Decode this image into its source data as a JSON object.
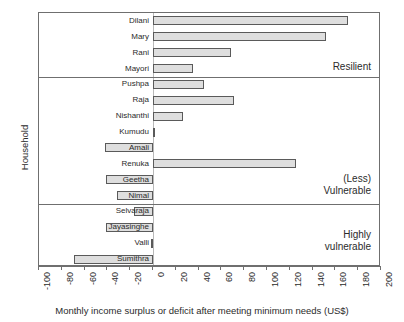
{
  "chart_data": {
    "type": "bar",
    "orientation": "horizontal",
    "title": "",
    "xlabel": "Monthly income surplus or deficit after meeting minimum needs (US$)",
    "ylabel": "Household",
    "xlim": [
      -100,
      200
    ],
    "xticks": [
      -100,
      -80,
      -60,
      -40,
      -20,
      0,
      20,
      40,
      60,
      80,
      100,
      120,
      140,
      160,
      180,
      200
    ],
    "xticklabels": [
      "-100",
      "-80",
      "-60",
      "-40",
      "-20",
      "0",
      "20",
      "40",
      "60",
      "80",
      "100",
      "120",
      "140",
      "160",
      "180",
      "200"
    ],
    "grid": false,
    "legend": false,
    "bar_fill": "#dedede",
    "bar_border": "#5a5a5a",
    "categories": [
      "Dilani",
      "Mary",
      "Rani",
      "Mayori",
      "Pushpa",
      "Raja",
      "Nishanthi",
      "Kumudu",
      "Amali",
      "Renuka",
      "Geetha",
      "Nimal",
      "Selvarajа",
      "Jayasinghe",
      "Valli",
      "Sumithra"
    ],
    "values": [
      171,
      152,
      68,
      35,
      45,
      71,
      26,
      2,
      -42,
      125,
      -41,
      -32,
      -17,
      -41,
      -2,
      -69
    ],
    "groups": [
      {
        "label": "Resilient",
        "members": [
          "Dilani",
          "Mary",
          "Rani",
          "Mayori"
        ]
      },
      {
        "label": "(Less)\nVulnerable",
        "members": [
          "Pushpa",
          "Raja",
          "Nishanthi",
          "Kumudu",
          "Amali",
          "Renuka",
          "Geetha",
          "Nimal"
        ]
      },
      {
        "label": "Highly\nvulnerable",
        "members": [
          "Selvaraja",
          "Jayasinghe",
          "Valli",
          "Sumithra"
        ]
      }
    ],
    "bars": [
      {
        "name": "Dilani",
        "value": 171,
        "label": "Dilani",
        "group": 0
      },
      {
        "name": "Mary",
        "value": 152,
        "label": "Mary",
        "group": 0
      },
      {
        "name": "Rani",
        "value": 68,
        "label": "Rani",
        "group": 0
      },
      {
        "name": "Mayori",
        "value": 35,
        "label": "Mayori",
        "group": 0
      },
      {
        "name": "Pushpa",
        "value": 45,
        "label": "Pushpa",
        "group": 1
      },
      {
        "name": "Raja",
        "value": 71,
        "label": "Raja",
        "group": 1
      },
      {
        "name": "Nishanthi",
        "value": 26,
        "label": "Nishanthi",
        "group": 1
      },
      {
        "name": "Kumudu",
        "value": 2,
        "label": "Kumudu",
        "group": 1
      },
      {
        "name": "Amali",
        "value": -42,
        "label": "Amali",
        "group": 1
      },
      {
        "name": "Renuka",
        "value": 125,
        "label": "Renuka",
        "group": 1
      },
      {
        "name": "Geetha",
        "value": -41,
        "label": "Geetha",
        "group": 1
      },
      {
        "name": "Nimal",
        "value": -32,
        "label": "Nimal",
        "group": 1
      },
      {
        "name": "Selvaraja",
        "value": -17,
        "label": "Selvaraja",
        "group": 2
      },
      {
        "name": "Jayasinghe",
        "value": -41,
        "label": "Jayasinghe",
        "group": 2
      },
      {
        "name": "Valli",
        "value": -2,
        "label": "Valli",
        "group": 2
      },
      {
        "name": "Sumithra",
        "value": -69,
        "label": "Sumithra",
        "group": 2
      }
    ]
  },
  "axis": {
    "y_title": "Household",
    "x_title": "Monthly income surplus or deficit after meeting minimum needs (US$)"
  },
  "annotations": {
    "group_1": "Resilient",
    "group_2": "(Less)\nVulnerable",
    "group_3": "Highly\nvulnerable"
  }
}
